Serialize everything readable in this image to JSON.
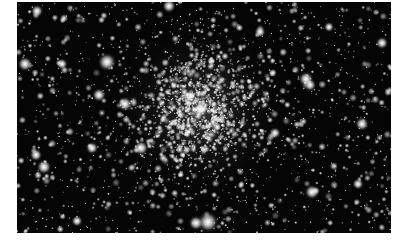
{
  "image": {
    "subject": "globular star cluster",
    "description": "Dense globular star cluster with a bright concentrated core on a black sky background",
    "frame": {
      "left": 17,
      "top": 2,
      "width": 374,
      "height": 231
    },
    "colors": {
      "sky": "#050505",
      "star": "#ffffff",
      "margin": "#ffffff"
    },
    "core": {
      "x": 183,
      "y": 108,
      "radius": 95
    },
    "bright_stars": [
      {
        "x": 90,
        "y": 60,
        "r": 3.2
      },
      {
        "x": 8,
        "y": 62,
        "r": 2.6
      },
      {
        "x": 20,
        "y": 9,
        "r": 2.2
      },
      {
        "x": 45,
        "y": 62,
        "r": 2.0
      },
      {
        "x": 82,
        "y": 93,
        "r": 2.4
      },
      {
        "x": 108,
        "y": 102,
        "r": 2.6
      },
      {
        "x": 152,
        "y": 4,
        "r": 2.4
      },
      {
        "x": 183,
        "y": 108,
        "r": 2.8
      },
      {
        "x": 173,
        "y": 95,
        "r": 2.0
      },
      {
        "x": 191,
        "y": 220,
        "r": 3.6
      },
      {
        "x": 179,
        "y": 221,
        "r": 2.6
      },
      {
        "x": 124,
        "y": 146,
        "r": 2.6
      },
      {
        "x": 75,
        "y": 146,
        "r": 2.2
      },
      {
        "x": 19,
        "y": 153,
        "r": 2.2
      },
      {
        "x": 27,
        "y": 165,
        "r": 2.6
      },
      {
        "x": 289,
        "y": 77,
        "r": 2.6
      },
      {
        "x": 293,
        "y": 83,
        "r": 2.2
      },
      {
        "x": 243,
        "y": 30,
        "r": 2.0
      },
      {
        "x": 365,
        "y": 41,
        "r": 2.2
      },
      {
        "x": 345,
        "y": 122,
        "r": 2.4
      },
      {
        "x": 295,
        "y": 190,
        "r": 2.6
      },
      {
        "x": 341,
        "y": 182,
        "r": 2.0
      },
      {
        "x": 258,
        "y": 131,
        "r": 2.0
      },
      {
        "x": 60,
        "y": 219,
        "r": 2.0
      },
      {
        "x": 312,
        "y": 25,
        "r": 1.8
      }
    ],
    "field_star_count": 1400,
    "core_star_count": 1100
  }
}
